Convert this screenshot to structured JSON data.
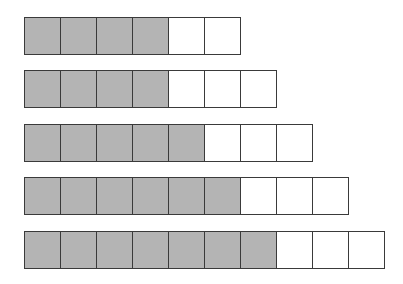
{
  "diagram": {
    "type": "fraction-strips",
    "colors": {
      "filled": "#b4b4b4",
      "empty": "#ffffff",
      "border": "#3a3a3a"
    },
    "rows": [
      {
        "filled": 4,
        "total": 6,
        "top": 17
      },
      {
        "filled": 4,
        "total": 7,
        "top": 70
      },
      {
        "filled": 5,
        "total": 8,
        "top": 124
      },
      {
        "filled": 6,
        "total": 9,
        "top": 177
      },
      {
        "filled": 7,
        "total": 10,
        "top": 231
      }
    ]
  }
}
